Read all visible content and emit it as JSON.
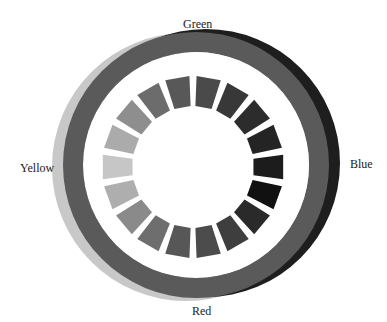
{
  "diagram": {
    "type": "color-wheel",
    "labels": {
      "green": "Green",
      "blue": "Blue",
      "red": "Red",
      "yellow": "Yellow"
    },
    "outer_rings": [
      {
        "name": "yellow-ring",
        "color": "#c8c8c8",
        "cx": 186,
        "cy": 167,
        "r_outer": 134,
        "r_inner": 112
      },
      {
        "name": "blue-ring",
        "color": "#1e1e1e",
        "cx": 206,
        "cy": 163,
        "r_outer": 134,
        "r_inner": 112
      },
      {
        "name": "green-red-ring",
        "color": "#5a5a5a",
        "cx": 196,
        "cy": 165,
        "r_outer": 133,
        "r_inner": 113
      }
    ],
    "inner_ring": {
      "cx": 193,
      "cy": 167,
      "r_outer": 91,
      "r_inner": 61,
      "segment_count": 18,
      "segment_span_deg": 15.5,
      "segments": [
        {
          "angle": 0,
          "color": "#1c1c1c"
        },
        {
          "angle": 20,
          "color": "#111111"
        },
        {
          "angle": 40,
          "color": "#2a2a2a"
        },
        {
          "angle": 60,
          "color": "#3e3e3e"
        },
        {
          "angle": 80,
          "color": "#4c4c4c"
        },
        {
          "angle": 100,
          "color": "#575757"
        },
        {
          "angle": 120,
          "color": "#6e6e6e"
        },
        {
          "angle": 140,
          "color": "#8a8a8a"
        },
        {
          "angle": 160,
          "color": "#aeaeae"
        },
        {
          "angle": 180,
          "color": "#c6c6c6"
        },
        {
          "angle": 200,
          "color": "#ababab"
        },
        {
          "angle": 220,
          "color": "#8e8e8e"
        },
        {
          "angle": 240,
          "color": "#6c6c6c"
        },
        {
          "angle": 260,
          "color": "#585858"
        },
        {
          "angle": 280,
          "color": "#4a4a4a"
        },
        {
          "angle": 300,
          "color": "#383838"
        },
        {
          "angle": 320,
          "color": "#2c2c2c"
        },
        {
          "angle": 340,
          "color": "#242424"
        }
      ]
    }
  }
}
